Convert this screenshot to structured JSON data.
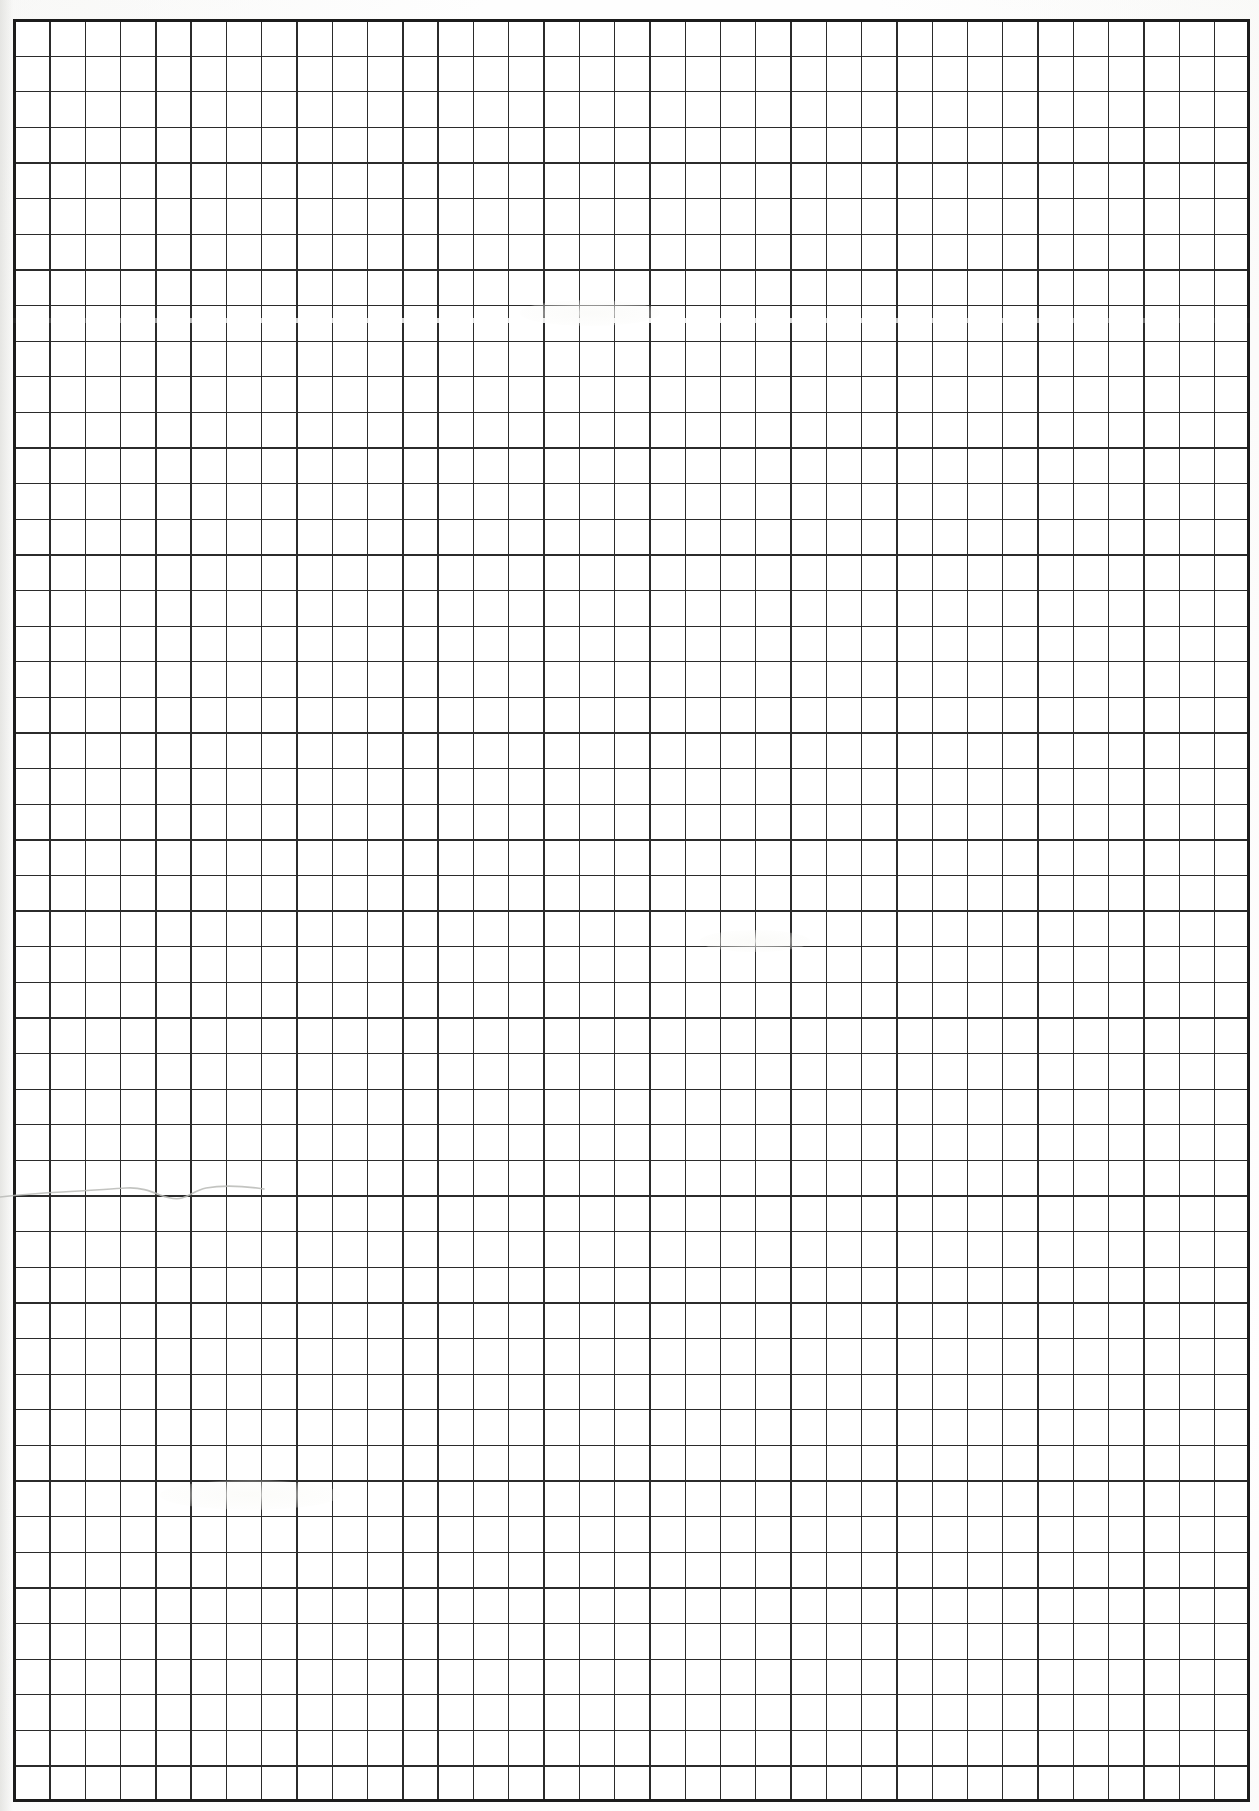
{
  "document": {
    "kind": "scanned-grid-paper",
    "title": "Blank Graph Paper Scan",
    "page_label": "",
    "background_color": "#fefefe",
    "paper_color": "#ffffff"
  },
  "grid": {
    "name": "ruled-square-grid",
    "columns": 35,
    "rows": 50,
    "cell_width_px": 35.29,
    "cell_height_px": 35.62,
    "origin_x_px": 14,
    "origin_y_px": 20,
    "width_px": 1235,
    "height_px": 1781,
    "line_color": "#2b2b2b",
    "border_color": "#1c1c1c",
    "border_width_px": 3
  },
  "marks": {
    "pencil_curve": {
      "name": "hand-drawn-pencil-curve",
      "color": "#b9bab6",
      "stroke_width_px": 1.6,
      "start_x_px": 0,
      "end_x_px": 265,
      "baseline_y_px": 1197,
      "path": "M0,37 C18,35 40,33 62,32 C86,31 108,29 126,28 C140,27 150,31 160,35 C168,38 175,40 182,38 C190,36 196,30 206,28 C222,25 244,26 264,29"
    },
    "scan_streak": {
      "name": "scanner-highlight-streak",
      "y_px": 318,
      "color": "#ffffff"
    },
    "smudges": [
      {
        "name": "paper-smudge-upper",
        "x_px": 520,
        "y_px": 300
      },
      {
        "name": "paper-smudge-middle",
        "x_px": 700,
        "y_px": 930
      },
      {
        "name": "paper-smudge-lower",
        "x_px": 160,
        "y_px": 1480
      }
    ]
  },
  "content": {
    "text_present": false,
    "annotations": [],
    "notes": ""
  }
}
